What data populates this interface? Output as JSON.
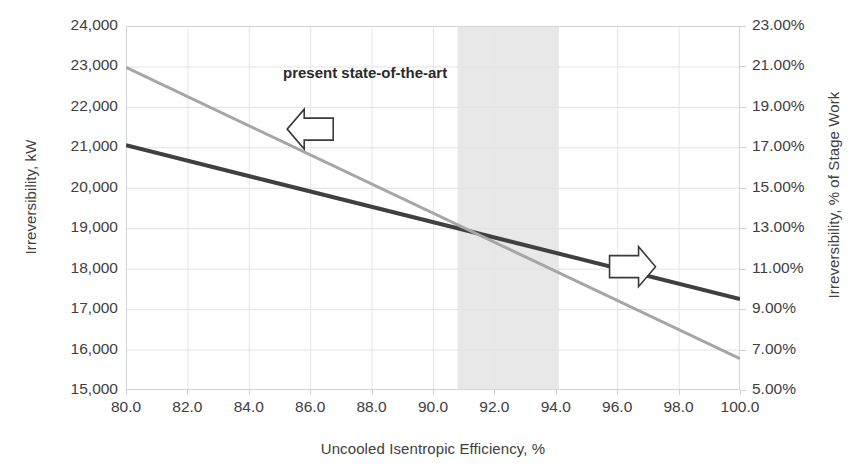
{
  "chart_data": {
    "type": "line",
    "title": "",
    "xlabel": "Uncooled Isentropic Efficiency, %",
    "ylabel": "Irreversibility, kW",
    "y2label": "Irreversibility, % of Stage Work",
    "xlim": [
      80.0,
      100.0
    ],
    "ylim": [
      15000,
      24000
    ],
    "y2lim": [
      5.0,
      23.0
    ],
    "xticks": [
      "80.0",
      "82.0",
      "84.0",
      "86.0",
      "88.0",
      "90.0",
      "92.0",
      "94.0",
      "96.0",
      "98.0",
      "100.0"
    ],
    "yticks": [
      "15,000",
      "16,000",
      "17,000",
      "18,000",
      "19,000",
      "20,000",
      "21,000",
      "22,000",
      "23,000",
      "24,000"
    ],
    "y2ticks": [
      "5.00%",
      "7.00%",
      "9.00%",
      "11.00%",
      "13.00%",
      "15.00%",
      "17.00%",
      "19.00%",
      "21.00%",
      "23.00%"
    ],
    "grid": true,
    "legend": "none",
    "series": [
      {
        "name": "Irreversibility, kW",
        "axis": "left",
        "color": "#404040",
        "width": 4.0,
        "x": [
          80.0,
          100.0
        ],
        "values": [
          21050,
          17250
        ]
      },
      {
        "name": "Irreversibility, % of Stage Work",
        "axis": "right",
        "color": "#a6a6a6",
        "width": 3.0,
        "x": [
          80.0,
          100.0
        ],
        "values": [
          20.95,
          6.55
        ]
      }
    ],
    "annotations": [
      {
        "kind": "band",
        "label": "present state-of-the-art",
        "x_start": 90.8,
        "x_end": 94.1,
        "color": "#e8e8e8"
      },
      {
        "kind": "arrow",
        "direction": "left",
        "points_to": "left-axis",
        "x": 86.0,
        "y": 21450
      },
      {
        "kind": "arrow",
        "direction": "right",
        "points_to": "right-axis",
        "x": 96.5,
        "y": 18050
      }
    ]
  }
}
